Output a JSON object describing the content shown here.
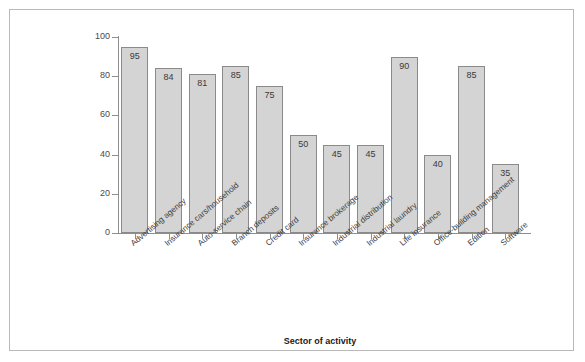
{
  "chart_data": {
    "type": "bar",
    "title": "",
    "xlabel": "Sector of activity",
    "ylabel": "Percent  increase in customer value",
    "ylim": [
      0,
      100
    ],
    "yticks": [
      0,
      20,
      40,
      60,
      80,
      100
    ],
    "grid": false,
    "legend": null,
    "categories": [
      "Advertising agency",
      "Insurance cars/household",
      "Auto-service chain",
      "Branch deposits",
      "Credit card",
      "Insurance brokerage",
      "Industrial distribution",
      "Industrial laundry",
      "Life insurance",
      "Office-building management",
      "Edition",
      "Software"
    ],
    "values": [
      95,
      84,
      81,
      85,
      75,
      50,
      45,
      45,
      90,
      40,
      85,
      35
    ],
    "bar_labels": [
      "95",
      "84",
      "81",
      "85",
      "75",
      "50",
      "45",
      "45",
      "90",
      "40",
      "85",
      "35"
    ],
    "colors": {
      "bar_fill": "#d4d4d4",
      "bar_edge": "#8a8a8a",
      "axis": "#8e8e8e",
      "frame": "#b9b9b9",
      "text": "#1a1a1a"
    }
  }
}
